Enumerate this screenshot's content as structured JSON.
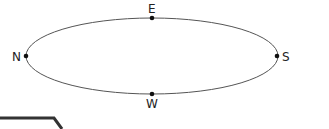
{
  "diagram": {
    "type": "ellipse-orbit",
    "points": [
      {
        "id": "north",
        "label": "N",
        "x": 26,
        "y": 56
      },
      {
        "id": "east",
        "label": "E",
        "x": 152,
        "y": 18
      },
      {
        "id": "south",
        "label": "S",
        "x": 277,
        "y": 56
      },
      {
        "id": "west",
        "label": "W",
        "x": 152,
        "y": 94
      }
    ],
    "ellipse": {
      "cx": 152,
      "cy": 56,
      "rx": 126,
      "ry": 38,
      "stroke": "#555555"
    },
    "colors": {
      "dot": "#111111",
      "text": "#222222",
      "shape": "#333333"
    }
  }
}
